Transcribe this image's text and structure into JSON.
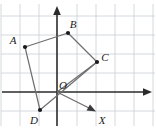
{
  "figure": {
    "type": "coordinate-geometry-diagram",
    "background_color": "#ffffff",
    "grid_color": "#c9cfd4",
    "axis_color": "#2b2b2b",
    "shape_color": "#6e6e6e",
    "point_color": "#1a1a1a",
    "label_color": "#1a1a1a",
    "width": 156,
    "height": 128
  },
  "grid": {
    "spacing_px": 19,
    "x_lines": [
      1,
      20,
      39,
      58,
      77,
      96,
      115,
      134,
      153
    ],
    "y_lines": [
      16,
      35,
      54,
      73,
      92,
      111
    ],
    "visible": true
  },
  "axes": {
    "origin_px": {
      "x": 57,
      "y": 92
    },
    "y_axis": {
      "x": 57,
      "top_y": 8,
      "bottom_y": 126,
      "arrow": "up"
    },
    "x_axis": {
      "y": 92,
      "left_x": 2,
      "right_x": 150,
      "arrow": "right"
    }
  },
  "points": [
    {
      "id": "A",
      "label": "A",
      "px": {
        "x": 25,
        "y": 47
      },
      "label_px": {
        "x": 13,
        "y": 44
      }
    },
    {
      "id": "B",
      "label": "B",
      "px": {
        "x": 68,
        "y": 33
      },
      "label_px": {
        "x": 72,
        "y": 28
      }
    },
    {
      "id": "C",
      "label": "C",
      "px": {
        "x": 97,
        "y": 62
      },
      "label_px": {
        "x": 102,
        "y": 60
      }
    },
    {
      "id": "D",
      "label": "D",
      "px": {
        "x": 40,
        "y": 110
      },
      "label_px": {
        "x": 31,
        "y": 124
      }
    },
    {
      "id": "O",
      "label": "O",
      "px": {
        "x": 57,
        "y": 92
      },
      "label_px": {
        "x": 60,
        "y": 89
      }
    }
  ],
  "polygon": {
    "name": "quadrilateral-ABCD",
    "vertex_order": [
      "A",
      "B",
      "C",
      "D"
    ],
    "path_px": "25,47 68,33 97,62 40,110 25,47"
  },
  "rays": [
    {
      "id": "ray-O-C",
      "from": "O",
      "to": "C",
      "from_px": {
        "x": 57,
        "y": 92
      },
      "to_px": {
        "x": 97,
        "y": 62
      },
      "arrow": false
    },
    {
      "id": "ray-O-X",
      "label": "X",
      "from_px": {
        "x": 57,
        "y": 92
      },
      "to_px": {
        "x": 95,
        "y": 111
      },
      "arrow": true,
      "label_px": {
        "x": 99,
        "y": 125
      }
    }
  ],
  "labels": {
    "A": "A",
    "B": "B",
    "C": "C",
    "D": "D",
    "O": "O",
    "X": "X"
  }
}
